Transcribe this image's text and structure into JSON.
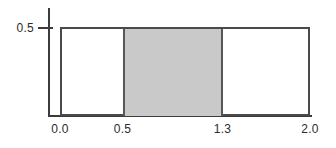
{
  "chart_data": {
    "type": "area",
    "title": "",
    "subtitle": "",
    "xlabel": "",
    "ylabel": "",
    "xlim": [
      0.0,
      2.0
    ],
    "ylim": [
      0.0,
      0.5
    ],
    "grid": false,
    "legend": null,
    "x_tick_labels": [
      "0.0",
      "0.5",
      "1.3",
      "2.0"
    ],
    "x_tick_values": [
      0.0,
      0.5,
      1.3,
      2.0
    ],
    "y_tick_labels": [
      "0.5"
    ],
    "y_tick_values": [
      0.5
    ],
    "series": [
      {
        "name": "uniform density",
        "kind": "step",
        "x": [
          0.0,
          2.0
        ],
        "values": [
          0.5,
          0.5
        ],
        "outlined": true,
        "filled": false
      }
    ],
    "shaded_region": {
      "name": "probability region",
      "x_start": 0.5,
      "x_end": 1.3,
      "height": 0.5,
      "area": 0.4,
      "fill_color": "#c9c9c9",
      "edge_color": "#575757"
    },
    "colors": {
      "axis": "#3c3c3c",
      "outline": "#4a4a4a",
      "shade_fill": "#c9c9c9",
      "shade_edge": "#575757",
      "text": "#2b2b2b",
      "background": "#ffffff"
    }
  },
  "axes": {
    "y_tick_0_label": "0.5",
    "x_tick_0_label": "0.0",
    "x_tick_1_label": "0.5",
    "x_tick_2_label": "1.3",
    "x_tick_3_label": "2.0"
  }
}
